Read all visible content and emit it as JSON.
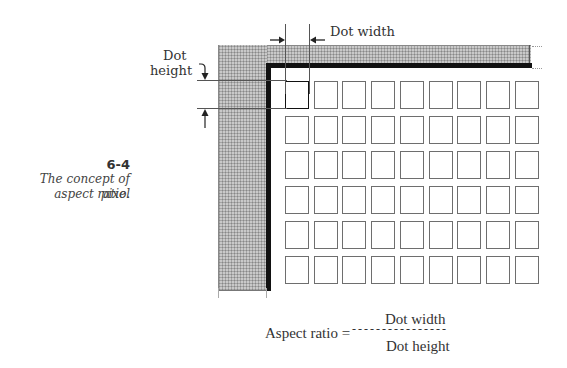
{
  "figure": {
    "number": "6-4",
    "caption_line1": "The concept of pixel",
    "caption_line2": "aspect ratio."
  },
  "annotations": {
    "dot_width_label": "Dot width",
    "dot_height_label_line1": "Dot",
    "dot_height_label_line2": "height"
  },
  "grid": {
    "columns": 9,
    "rows": 6,
    "highlighted_cell": [
      0,
      0
    ]
  },
  "formula": {
    "lhs": "Aspect ratio =",
    "numerator": "Dot width",
    "denominator": "Dot height",
    "dashes": "- - - - - - - - - - - - - - - -"
  },
  "colors": {
    "border_band": "#c9c9c9",
    "frame": "#111111",
    "cell_outline": "#6e6e6e",
    "highlight_cell": "#1e1e1e"
  }
}
